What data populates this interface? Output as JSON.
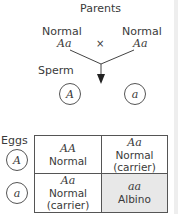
{
  "title": "Parents",
  "parents": [
    {
      "phenotype": "Normal",
      "genotype": "Aa"
    },
    {
      "phenotype": "Normal",
      "genotype": "Aa"
    }
  ],
  "cross_symbol": "×",
  "sperm_label": "Sperm",
  "eggs_label": "Eggs",
  "sperm_alleles": [
    "A",
    "a"
  ],
  "egg_alleles": [
    "A",
    "a"
  ],
  "cells": [
    {
      "genotype": "AA",
      "phenotype": "Normal",
      "note": ""
    },
    {
      "genotype": "Aa",
      "phenotype": "Normal",
      "note": "(carrier)"
    },
    {
      "genotype": "Aa",
      "phenotype": "Normal",
      "note": "(carrier)"
    },
    {
      "genotype": "aa",
      "phenotype": "Albino",
      "note": ""
    }
  ],
  "colors": {
    "albino_fill": "#e8e8e8",
    "line": "#555555"
  }
}
